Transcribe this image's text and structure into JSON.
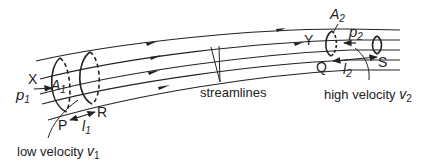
{
  "diagram": {
    "colors": {
      "ink": "#222222",
      "background": "#ffffff"
    },
    "labels": {
      "X": "X",
      "Y": "Y",
      "P": "P",
      "R": "R",
      "Q": "Q",
      "S": "S",
      "A1": "A",
      "A1_sub": "1",
      "A2": "A",
      "A2_sub": "2",
      "p1": "p",
      "p1_sub": "1",
      "p2": "p",
      "p2_sub": "2",
      "l1": "l",
      "l1_sub": "1",
      "l2": "l",
      "l2_sub": "2",
      "streamlines": "streamlines",
      "low_velocity": "low velocity ",
      "v1": "v",
      "v1_sub": "1",
      "high_velocity": "high velocity ",
      "v2": "v",
      "v2_sub": "2"
    }
  }
}
